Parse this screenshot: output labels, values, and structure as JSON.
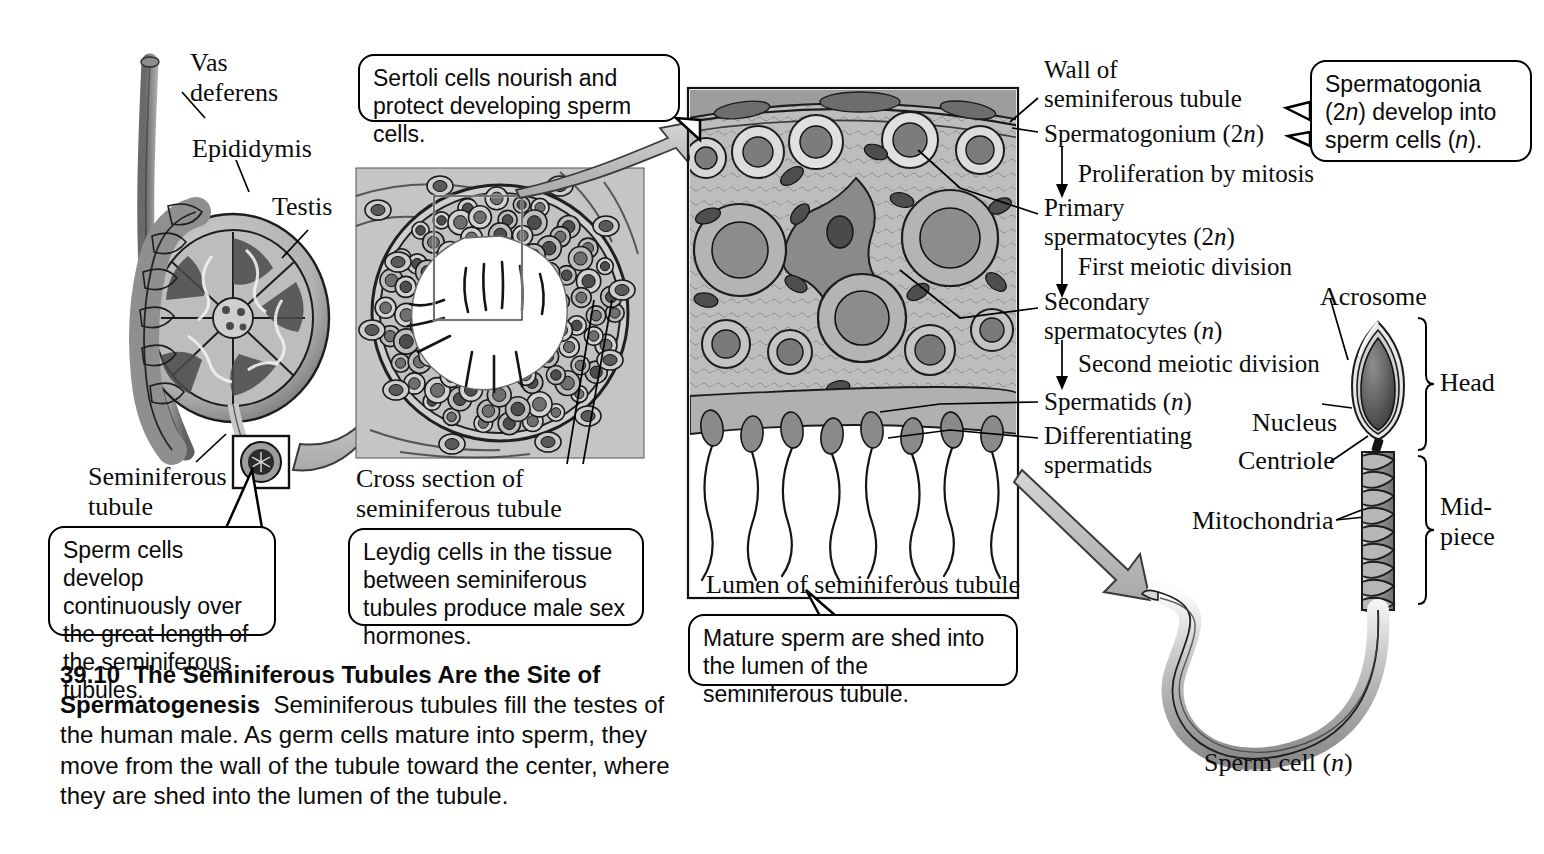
{
  "figure": {
    "number": "39.10",
    "title": "The Seminiferous Tubules Are the Site of Spermatogenesis",
    "caption_body": "Seminiferous tubules fill the testes of the human male. As germ cells mature into sperm, they move from the wall of the tubule toward the center, where they are shed into the lumen of the tubule."
  },
  "anatomy_labels": {
    "vas_deferens": "Vas\ndeferens",
    "epididymis": "Epididymis",
    "testis": "Testis",
    "seminiferous_tubule": "Seminiferous\ntubule",
    "cross_section": "Cross section of\nseminiferous tubule",
    "lumen": "Lumen of seminiferous tubule"
  },
  "callouts": {
    "sertoli": "Sertoli cells nourish and protect developing sperm cells.",
    "sperm_develop": "Sperm cells develop continuously over the great length of the seminiferous tubules.",
    "leydig": "Leydig cells in the tissue between seminiferous tubules produce male sex hormones.",
    "mature_sperm": "Mature sperm are shed into the lumen of the seminiferous tubule.",
    "spermatogonia": "Spermatogonia (2n) develop into sperm cells (n)."
  },
  "stages": {
    "wall": "Wall of\nseminiferous tubule",
    "spermatogonium": "Spermatogonium (2n)",
    "step_mitosis": "Proliferation by mitosis",
    "primary": "Primary\nspermatocytes (2n)",
    "step_meiosis1": "First meiotic division",
    "secondary": "Secondary\nspermatocytes (n)",
    "step_meiosis2": "Second meiotic division",
    "spermatids": "Spermatids (n)",
    "differentiating": "Differentiating\nspermatids"
  },
  "sperm_cell": {
    "acrosome": "Acrosome",
    "nucleus": "Nucleus",
    "centriole": "Centriole",
    "mitochondria": "Mitochondria",
    "head": "Head",
    "midpiece": "Mid-\npiece",
    "name": "Sperm cell (n)"
  },
  "colors": {
    "ink": "#0c0c0c",
    "tissue_light": "#c9c9c9",
    "tissue_mid": "#9a9a9a",
    "tissue_dark": "#5a5a5a",
    "arrow_gray": "#b8b8b8"
  }
}
